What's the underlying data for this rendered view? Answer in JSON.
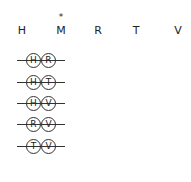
{
  "header": {
    "letters": [
      "H",
      "M",
      "R",
      "T",
      "V"
    ],
    "marker": "*",
    "marked_letter": "M"
  },
  "pairs": [
    {
      "a": "H",
      "b": "R"
    },
    {
      "a": "H",
      "b": "T"
    },
    {
      "a": "H",
      "b": "V"
    },
    {
      "a": "R",
      "b": "V"
    },
    {
      "a": "T",
      "b": "V"
    }
  ]
}
